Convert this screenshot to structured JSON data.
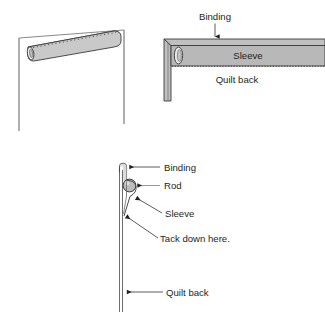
{
  "figure": {
    "background_color": "#ffffff",
    "ink_color": "#231f20",
    "fabric_fill": "#c9c9c9",
    "binding_fill": "#b3b3b3",
    "sleeve_fill": "#b8b8b8",
    "rod_fill": "#bdbdbd",
    "highlight_fill": "#e8e8e8",
    "stitch_color": "#555555"
  },
  "panels": [
    {
      "id": "perspective-view",
      "name": "Quilt back with sleeve, perspective view",
      "labels": []
    },
    {
      "id": "front-detail-view",
      "name": "Top corner of quilt back showing binding and sleeve",
      "labels": [
        {
          "key": "binding",
          "text": "Binding"
        },
        {
          "key": "sleeve",
          "text": "Sleeve"
        },
        {
          "key": "quilt_back",
          "text": "Quilt back"
        }
      ]
    },
    {
      "id": "cross-section-view",
      "name": "Side cross-section of sleeve, rod and quilt back",
      "labels": [
        {
          "key": "binding",
          "text": "Binding"
        },
        {
          "key": "rod",
          "text": "Rod"
        },
        {
          "key": "sleeve",
          "text": "Sleeve"
        },
        {
          "key": "tack",
          "text": "Tack down here."
        },
        {
          "key": "quilt_back",
          "text": "Quilt back"
        }
      ]
    }
  ],
  "labels": {
    "panel2_binding": "Binding",
    "panel2_sleeve": "Sleeve",
    "panel2_quilt_back": "Quilt back",
    "panel3_binding": "Binding",
    "panel3_rod": "Rod",
    "panel3_sleeve": "Sleeve",
    "panel3_tack": "Tack down here.",
    "panel3_quilt_back": "Quilt back"
  }
}
